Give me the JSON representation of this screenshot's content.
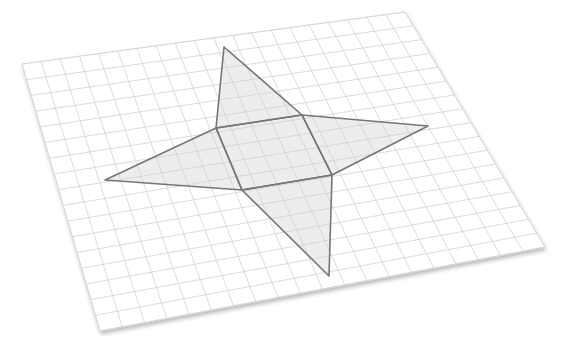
{
  "diagram": {
    "colors": {
      "background": "#ffffff",
      "sheet": "#ffffff",
      "sheet_shadow": "#d9d9d9",
      "grid_line": "#d2d2d2",
      "outline": "#767676",
      "fill": "#ededed"
    },
    "sheet": {
      "corners": {
        "top_left": [
          22,
          64
        ],
        "top_right": [
          405,
          12
        ],
        "bottom_right": [
          545,
          247
        ],
        "bottom_left": [
          100,
          331
        ]
      },
      "columns": 20,
      "rows": 17
    },
    "net": {
      "square_base": [
        [
          216,
          128
        ],
        [
          302,
          115
        ],
        [
          332,
          175
        ],
        [
          242,
          190
        ]
      ],
      "triangles": [
        {
          "name": "top",
          "points": [
            [
              216,
              128
            ],
            [
              224,
              47
            ],
            [
              302,
              115
            ]
          ]
        },
        {
          "name": "right",
          "points": [
            [
              302,
              115
            ],
            [
              428,
              126
            ],
            [
              332,
              175
            ]
          ]
        },
        {
          "name": "bottom",
          "points": [
            [
              332,
              175
            ],
            [
              329,
              276
            ],
            [
              242,
              190
            ]
          ]
        },
        {
          "name": "left",
          "points": [
            [
              242,
              190
            ],
            [
              105,
              180
            ],
            [
              216,
              128
            ]
          ]
        }
      ]
    }
  }
}
